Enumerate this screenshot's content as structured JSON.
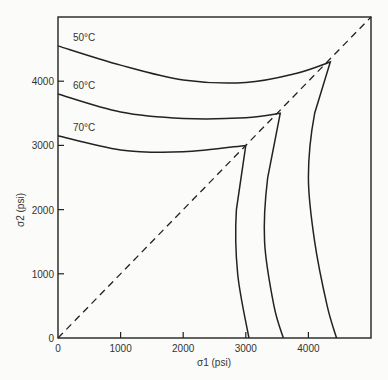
{
  "chart_data": {
    "type": "line",
    "title": "",
    "xlabel": "σ1 (psi)",
    "ylabel": "σ2 (psi)",
    "xlim": [
      0,
      5000
    ],
    "ylim": [
      0,
      5000
    ],
    "x_ticks": [
      "0",
      "1000",
      "2000",
      "3000",
      "4000"
    ],
    "y_ticks": [
      "0",
      "1000",
      "2000",
      "3000",
      "4000"
    ],
    "grid": false,
    "legend": "inline curve labels",
    "reference_line": {
      "name": "σ1 = σ2",
      "style": "dashed",
      "points": [
        [
          0,
          0
        ],
        [
          5000,
          5000
        ]
      ]
    },
    "series": [
      {
        "name": "50°C",
        "points": [
          [
            0,
            4550
          ],
          [
            1000,
            4250
          ],
          [
            2000,
            4020
          ],
          [
            3000,
            3980
          ],
          [
            3800,
            4120
          ],
          [
            4350,
            4300
          ],
          [
            4100,
            3500
          ],
          [
            4000,
            2500
          ],
          [
            4100,
            1500
          ],
          [
            4300,
            500
          ],
          [
            4450,
            0
          ]
        ]
      },
      {
        "name": "60°C",
        "points": [
          [
            0,
            3800
          ],
          [
            1000,
            3520
          ],
          [
            2000,
            3420
          ],
          [
            3000,
            3430
          ],
          [
            3550,
            3500
          ],
          [
            3350,
            2500
          ],
          [
            3300,
            1500
          ],
          [
            3450,
            500
          ],
          [
            3600,
            0
          ]
        ]
      },
      {
        "name": "70°C",
        "points": [
          [
            0,
            3150
          ],
          [
            1000,
            2930
          ],
          [
            2000,
            2900
          ],
          [
            3000,
            3000
          ],
          [
            2850,
            2000
          ],
          [
            2870,
            1000
          ],
          [
            3050,
            0
          ]
        ]
      }
    ]
  }
}
